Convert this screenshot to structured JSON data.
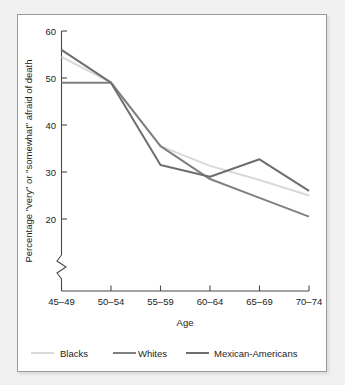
{
  "chart_data": {
    "type": "line",
    "title": "",
    "xlabel": "Age",
    "ylabel": "Percentage \"very\" or \"somewhat\" afraid of death",
    "categories": [
      "45–49",
      "50–54",
      "55–59",
      "60–64",
      "65–69",
      "70–74"
    ],
    "yticks": [
      20,
      30,
      40,
      50,
      60
    ],
    "ylim": [
      18,
      60
    ],
    "axis_break": true,
    "grid": false,
    "legend_position": "bottom",
    "series": [
      {
        "name": "Blacks",
        "color": "#d9d9d9",
        "values": [
          54.5,
          49.0,
          35.5,
          31.3,
          28.3,
          25.0
        ]
      },
      {
        "name": "Whites",
        "color": "#808080",
        "values": [
          49.0,
          49.0,
          35.5,
          28.5,
          24.5,
          20.5
        ]
      },
      {
        "name": "Mexican-Americans",
        "color": "#6e6e6e",
        "values": [
          56.0,
          49.0,
          31.5,
          29.0,
          32.7,
          26.0
        ]
      }
    ]
  },
  "axis": {
    "y_tick_labels": [
      "60",
      "50",
      "40",
      "30",
      "20"
    ],
    "x_tick_labels": [
      "45–49",
      "50–54",
      "55–59",
      "60–64",
      "65–69",
      "70–74"
    ],
    "x_title": "Age",
    "y_title": "Percentage \"very\" or \"somewhat\" afraid of death"
  },
  "legend": {
    "items": [
      {
        "label": "Blacks",
        "color": "#d9d9d9"
      },
      {
        "label": "Whites",
        "color": "#808080"
      },
      {
        "label": "Mexican-Americans",
        "color": "#6e6e6e"
      }
    ]
  }
}
